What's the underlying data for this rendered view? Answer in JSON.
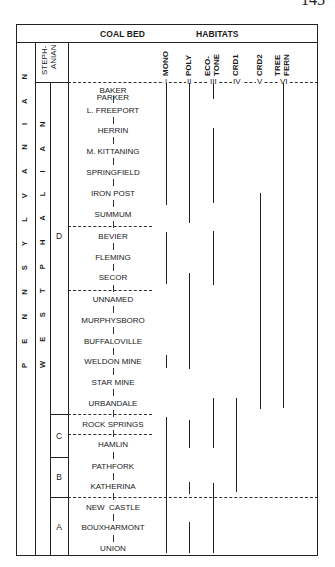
{
  "page": {
    "number": "145"
  },
  "header": {
    "coal_bed": "COAL BED",
    "habitats": "HABITATS",
    "stephanian": "STEPH-\nANIAN",
    "stephanian_line1": "STEPH-",
    "stephanian_line2": "ANIAN"
  },
  "periods": {
    "pennsylvanian": "P E N N S Y L V A N I A N",
    "westphalian": "W E S T P H A L I A N"
  },
  "stages": {
    "D": "D",
    "C": "C",
    "B": "B",
    "A": "A"
  },
  "habitats": [
    {
      "label": "MONO",
      "roman": "I"
    },
    {
      "label": "POLY",
      "roman": "II"
    },
    {
      "label_line1": "ECO-",
      "label_line2": "TONE",
      "roman": "III"
    },
    {
      "label": "CRD1",
      "roman": "IV"
    },
    {
      "label": "CRD2",
      "roman": "V"
    },
    {
      "label_line1": "TREE",
      "label_line2": "FERN",
      "roman": "VI"
    }
  ],
  "coal_beds": [
    "PARKER",
    "BAKER",
    "L. FREEPORT",
    "HERRIN",
    "M. KITTANING",
    "SPRINGFIELD",
    "IRON POST",
    "SUMMUM",
    "BEVIER",
    "FLEMING",
    "SECOR",
    "UNNAMED",
    "MURPHYSBORO",
    "BUFFALOVILLE",
    "WELDON MINE",
    "STAR MINE",
    "URBANDALE",
    "ROCK SPRINGS",
    "HAMLIN",
    "PATHFORK",
    "KATHERINA",
    "NEW  CASTLE",
    "BOUXHARMONT",
    "UNION"
  ]
}
